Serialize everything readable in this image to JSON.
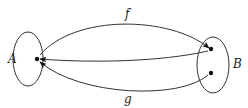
{
  "diagram": {
    "title": "",
    "sets": [
      {
        "id": "A",
        "label": "A",
        "elements": 1
      },
      {
        "id": "B",
        "label": "B",
        "elements": 2
      }
    ],
    "mappings": [
      {
        "id": "f",
        "label": "f",
        "from": "A",
        "to": "B",
        "description": "maps A's element to B's top element"
      },
      {
        "id": "g",
        "label": "g",
        "from": "B",
        "to": "A",
        "description": "maps both of B's elements to A's element"
      }
    ],
    "labels": {
      "set_a": "A",
      "set_b": "B",
      "map_f": "f",
      "map_g": "g"
    }
  }
}
